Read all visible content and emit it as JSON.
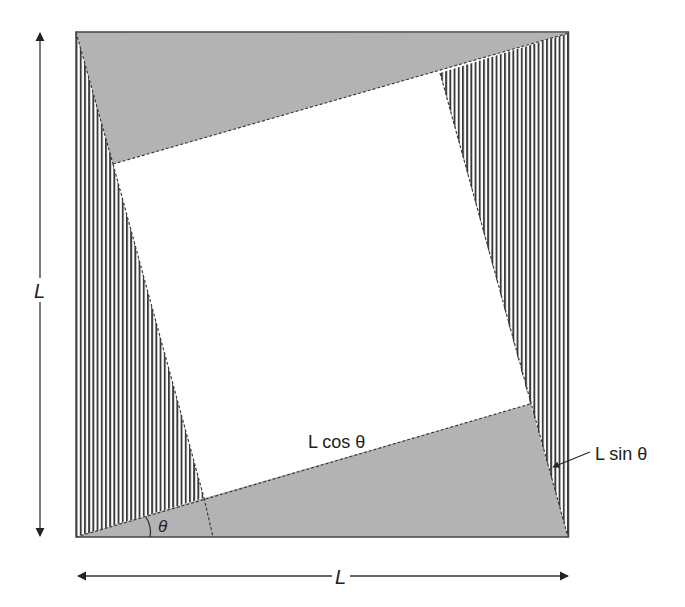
{
  "figure": {
    "labels": {
      "side_vertical": "L",
      "side_horizontal": "L",
      "adjacent": "L cos θ",
      "opposite": "L sin θ",
      "angle": "θ"
    },
    "colors": {
      "gray_fill": "#b3b3b3",
      "stripe": "#3a3a3a",
      "stroke": "#444444",
      "inner": "#ffffff"
    },
    "geometry": {
      "outer": {
        "tl": [
          76,
          32
        ],
        "tr": [
          569,
          33
        ],
        "br": [
          568,
          537
        ],
        "bl": [
          76,
          537
        ]
      },
      "inner": {
        "tl": [
          113,
          164
        ],
        "tr": [
          440,
          73
        ],
        "br": [
          530,
          404
        ],
        "bl": [
          204,
          498
        ]
      },
      "bottom_dash_end": [
        213,
        537
      ]
    }
  }
}
